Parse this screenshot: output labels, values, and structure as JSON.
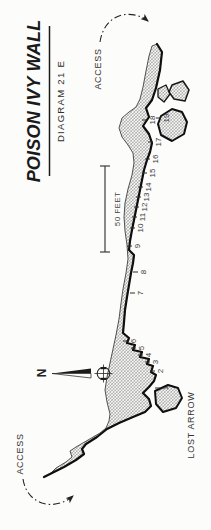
{
  "title": {
    "main": "POISON IVY WALL",
    "subtitle": "DIAGRAM 21 E"
  },
  "labels": {
    "access_top": "ACCESS",
    "access_bottom": "ACCESS",
    "lost_arrow": "LOST ARROW",
    "north": "N",
    "scale_bar": "50 FEET"
  },
  "routes": [
    {
      "n": "1",
      "x": 165,
      "y": 388
    },
    {
      "n": "2",
      "x": 160,
      "y": 371
    },
    {
      "n": "3",
      "x": 155,
      "y": 362
    },
    {
      "n": "4",
      "x": 148,
      "y": 355
    },
    {
      "n": "5",
      "x": 141,
      "y": 348
    },
    {
      "n": "6",
      "x": 133,
      "y": 341
    },
    {
      "n": "7",
      "x": 140,
      "y": 293
    },
    {
      "n": "8",
      "x": 143,
      "y": 272
    },
    {
      "n": "9",
      "x": 137,
      "y": 246
    },
    {
      "n": "10",
      "x": 140,
      "y": 228
    },
    {
      "n": "11",
      "x": 142,
      "y": 217
    },
    {
      "n": "12",
      "x": 144,
      "y": 207
    },
    {
      "n": "13",
      "x": 146,
      "y": 197
    },
    {
      "n": "14",
      "x": 148,
      "y": 187
    },
    {
      "n": "15",
      "x": 152,
      "y": 173
    },
    {
      "n": "16",
      "x": 155,
      "y": 159
    },
    {
      "n": "17",
      "x": 158,
      "y": 142
    },
    {
      "n": "18",
      "x": 152,
      "y": 120
    },
    {
      "n": "19",
      "x": 166,
      "y": 118
    }
  ],
  "colors": {
    "ink": "#1f1f1f",
    "face": "#0f0f0f",
    "hatch": "#767676",
    "paper": "#fcfcfa"
  }
}
